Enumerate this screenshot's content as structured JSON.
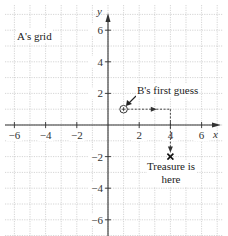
{
  "chart_data": {
    "type": "diagram",
    "title": "A's grid",
    "xlabel": "x",
    "ylabel": "y",
    "xlim": [
      -7,
      7
    ],
    "ylim": [
      -7,
      7
    ],
    "grid": true,
    "x_ticks": [
      -6,
      -4,
      -2,
      2,
      4,
      6
    ],
    "y_ticks": [
      6,
      4,
      2,
      -2,
      -4,
      -6
    ],
    "x_tick_labels": [
      "−6",
      "−4",
      "−2",
      "2",
      "4",
      "6"
    ],
    "y_tick_labels": [
      "6",
      "4",
      "2",
      "−2",
      "−4",
      "−6"
    ],
    "points": [
      {
        "name": "B's first guess",
        "x": 1,
        "y": 1,
        "marker": "circle-plus"
      },
      {
        "name": "Treasure is here",
        "x": 4,
        "y": -2,
        "marker": "cross"
      }
    ],
    "paths": [
      {
        "from": [
          1,
          1
        ],
        "to": [
          4,
          1
        ],
        "style": "dashed-arrow"
      },
      {
        "from": [
          4,
          1
        ],
        "to": [
          4,
          -2
        ],
        "style": "dashed-arrow"
      }
    ]
  },
  "labels": {
    "grid_title": "A's grid",
    "first_guess": "B's first guess",
    "treasure_line1": "Treasure is",
    "treasure_line2": "here",
    "x_axis": "x",
    "y_axis": "y"
  },
  "colors": {
    "axis": "#333333",
    "grid": "#b8b8b8",
    "background": "#ffffff"
  },
  "layout": {
    "origin_px": [
      108,
      125
    ],
    "unit_px_x": 15.6,
    "unit_px_y": 15.8
  }
}
